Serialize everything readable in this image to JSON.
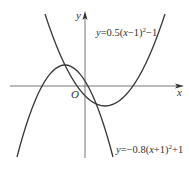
{
  "figure": {
    "axes": {
      "x_label": "x",
      "y_label": "y",
      "origin_label": "O"
    },
    "curves": [
      {
        "name": "parabola-up",
        "equation_label": {
          "y": "y",
          "eq": "=0.5(",
          "x": "x",
          "rest": "−1)",
          "sup": "2",
          "tail": "−1"
        },
        "a": 0.5,
        "h": 1,
        "k": -1
      },
      {
        "name": "parabola-down",
        "equation_label": {
          "y": "y",
          "eq": "=−0.8(",
          "x": "x",
          "rest": "+1)",
          "sup": "2",
          "tail": "+1"
        },
        "a": -0.8,
        "h": -1,
        "k": 1
      }
    ],
    "colors": {
      "curve": "#3a3a3a",
      "axis": "#555555",
      "text": "#333333"
    }
  }
}
